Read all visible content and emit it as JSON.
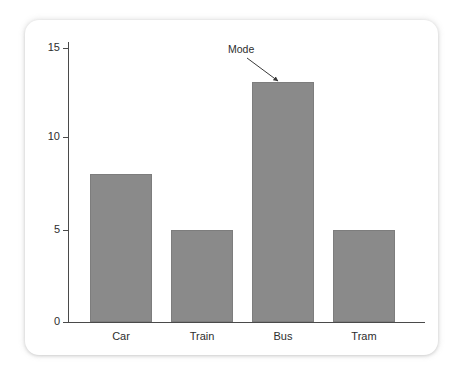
{
  "chart_data": {
    "type": "bar",
    "title": "",
    "xlabel": "",
    "ylabel": "",
    "categories": [
      "Car",
      "Train",
      "Bus",
      "Tram"
    ],
    "values": [
      8,
      5,
      13,
      5
    ],
    "series": [
      {
        "name": "Frequency",
        "values": [
          8,
          5,
          13,
          5
        ]
      }
    ],
    "ylim": [
      0,
      15
    ],
    "yticks": [
      0,
      5,
      10,
      15
    ],
    "ytick_labels": [
      "0",
      "5",
      "10",
      "15"
    ],
    "grid": false,
    "legend": false,
    "legend_position": "none",
    "bar_color": "#8a8a8a",
    "axis_color": "#4a4a4a",
    "annotations": [
      {
        "text": "Mode",
        "points_to_category": "Bus",
        "points_to_value": 13,
        "arrow": true
      }
    ]
  },
  "card": {
    "background": "#ffffff"
  }
}
